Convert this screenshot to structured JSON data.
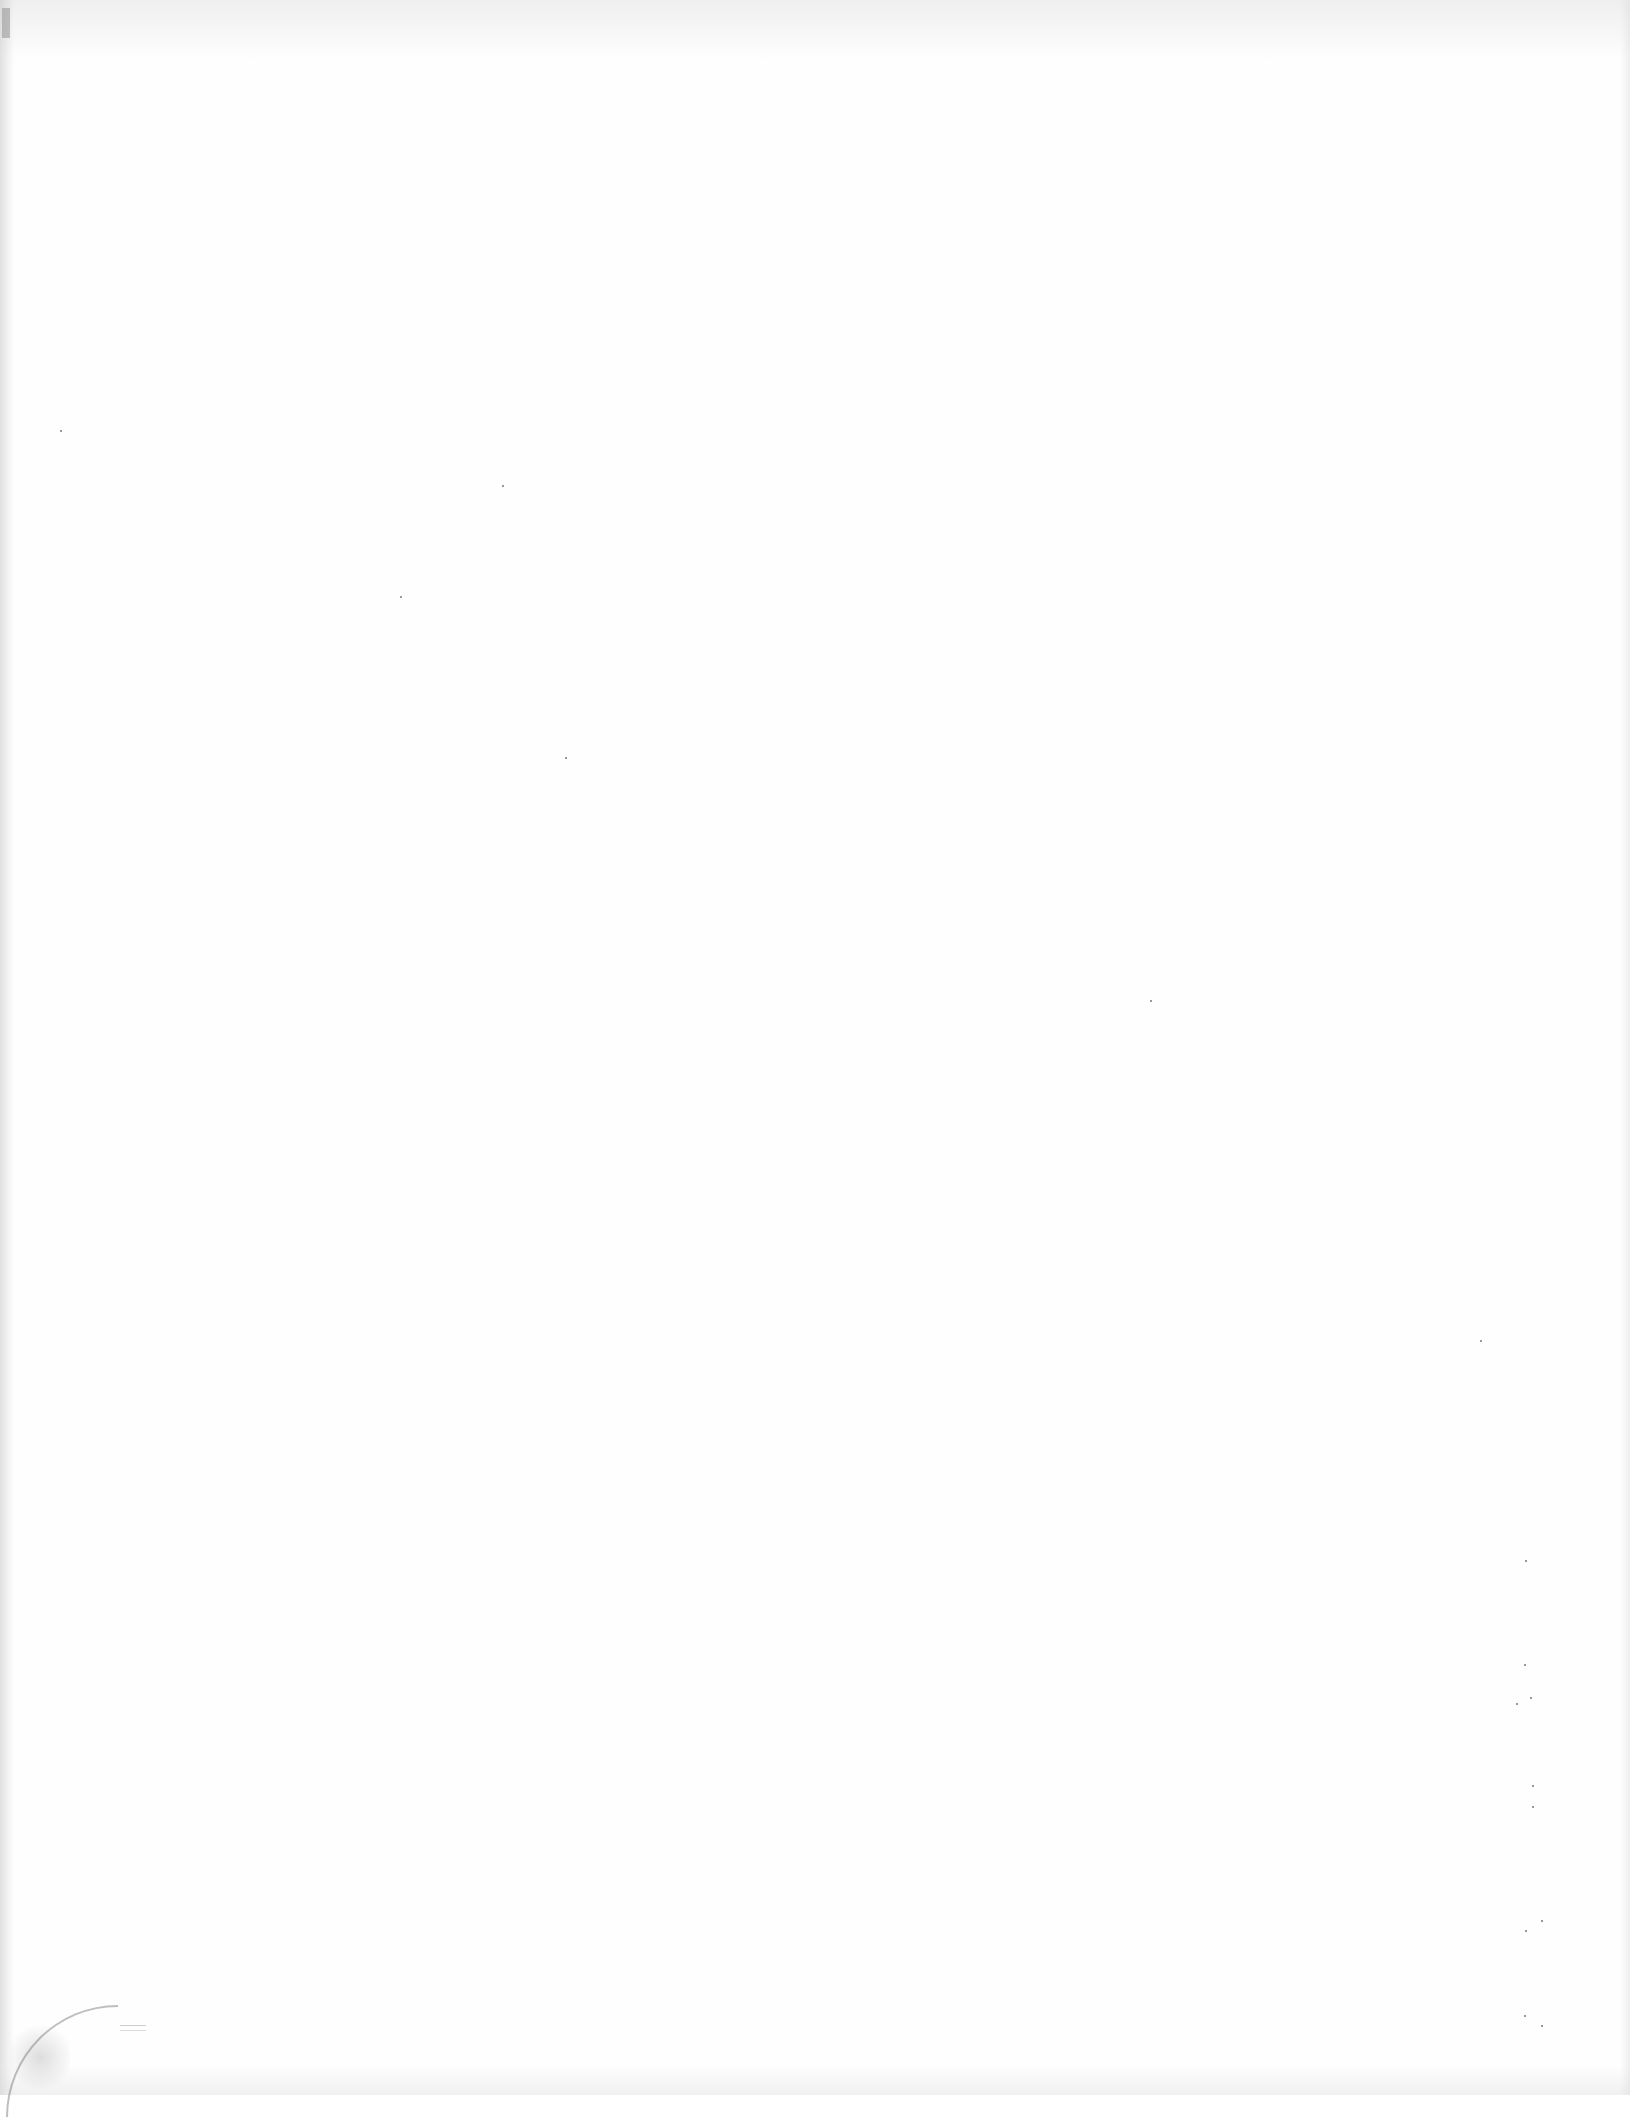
{
  "page": {
    "type": "blank-scanned-page",
    "text_content": "",
    "background_color": "#fefefe"
  },
  "artifacts": {
    "specks": [
      {
        "x": 400,
        "y": 596
      },
      {
        "x": 565,
        "y": 757
      },
      {
        "x": 502,
        "y": 485
      },
      {
        "x": 1524,
        "y": 1664
      },
      {
        "x": 1530,
        "y": 1697
      },
      {
        "x": 1516,
        "y": 1703
      },
      {
        "x": 1532,
        "y": 1785
      },
      {
        "x": 1532,
        "y": 1806
      },
      {
        "x": 1525,
        "y": 1930
      },
      {
        "x": 1541,
        "y": 1920
      },
      {
        "x": 1524,
        "y": 2015
      },
      {
        "x": 1541,
        "y": 2025
      },
      {
        "x": 1150,
        "y": 1000
      },
      {
        "x": 1525,
        "y": 1560
      },
      {
        "x": 60,
        "y": 430
      },
      {
        "x": 1480,
        "y": 1340
      }
    ]
  }
}
